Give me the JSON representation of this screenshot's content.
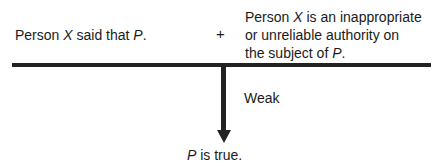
{
  "premise1": {
    "a": "Person ",
    "b": "X",
    "c": " said that ",
    "d": "P",
    "e": "."
  },
  "plus": "+",
  "premise2": {
    "line1a": "Person ",
    "line1b": "X",
    "line1c": " is an inappropriate",
    "line2": "or unreliable authority on",
    "line3a": "the subject of ",
    "line3b": "P",
    "line3c": "."
  },
  "strength": "Weak",
  "conclusion": {
    "a": "P",
    "b": " is true."
  }
}
